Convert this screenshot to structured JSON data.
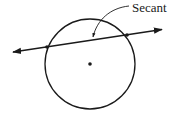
{
  "diagram": {
    "label": "Secant",
    "stroke_color": "#1a1a1a",
    "background": "#ffffff",
    "circle": {
      "cx": 90,
      "cy": 64,
      "r": 45
    },
    "center_point": {
      "x": 90,
      "y": 64
    },
    "secant_line": {
      "x1": 12,
      "y1": 52,
      "x2": 163,
      "y2": 29,
      "arrows": "both"
    },
    "intersection_points": [
      {
        "x": 47,
        "y": 47
      },
      {
        "x": 127,
        "y": 35
      }
    ],
    "pointer_arrow": {
      "from": [
        129,
        6
      ],
      "to": [
        93,
        38
      ]
    }
  }
}
